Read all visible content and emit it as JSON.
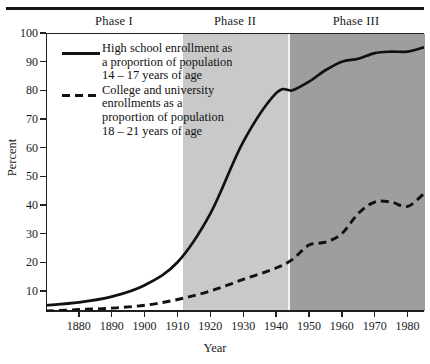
{
  "figure": {
    "y_axis_title": "Percent",
    "x_axis_title": "Year"
  },
  "phases": [
    {
      "name": "phase-1",
      "label": "Phase I",
      "start": 1870,
      "end": 1910,
      "shade": "#ffffff"
    },
    {
      "name": "phase-2",
      "label": "Phase II",
      "start": 1910,
      "end": 1940,
      "shade": "#c9c9c9"
    },
    {
      "name": "phase-3",
      "label": "Phase III",
      "start": 1940,
      "end": 1985,
      "shade": "#9e9e9e"
    }
  ],
  "legend": {
    "entries": [
      {
        "style": "solid",
        "line1": "High school enrollment as",
        "line2": "a proportion of population",
        "line3": "14 – 17 years of age"
      },
      {
        "style": "dashed",
        "line1": "College and university",
        "line2": "enrollments as a",
        "line3": "proportion of population",
        "line4": "18 – 21 years of age"
      }
    ]
  },
  "axes": {
    "y_ticks": [
      "100",
      "90",
      "80",
      "70",
      "60",
      "50",
      "40",
      "30",
      "20",
      "10"
    ],
    "y_values": [
      100,
      90,
      80,
      70,
      60,
      50,
      40,
      30,
      20,
      10
    ],
    "x_ticks": [
      "1880",
      "1890",
      "1900",
      "1910",
      "1920",
      "1930",
      "1940",
      "1950",
      "1960",
      "1970",
      "1980"
    ],
    "x_values": [
      1880,
      1890,
      1900,
      1910,
      1920,
      1930,
      1940,
      1950,
      1960,
      1970,
      1980
    ]
  },
  "chart_data": {
    "type": "line",
    "title": "",
    "xlabel": "Year",
    "ylabel": "Percent",
    "xlim": [
      1870,
      1985
    ],
    "ylim": [
      3,
      100
    ],
    "grid": false,
    "legend_position": "upper-left-inside",
    "annotations": [
      "Phase I",
      "Phase II",
      "Phase III"
    ],
    "phase_boundaries": [
      1910,
      1940
    ],
    "series": [
      {
        "name": "High school enrollment as a proportion of population 14 – 17 years of age",
        "style": "solid",
        "color": "#111111",
        "x": [
          1870,
          1880,
          1890,
          1900,
          1910,
          1920,
          1930,
          1940,
          1945,
          1950,
          1955,
          1960,
          1965,
          1970,
          1975,
          1980,
          1985
        ],
        "y": [
          5,
          6,
          8,
          12,
          20,
          37,
          62,
          79,
          80,
          83,
          87,
          90,
          91,
          93,
          93.5,
          93.5,
          95
        ]
      },
      {
        "name": "College and university enrollments as a proportion of population 18 – 21 years of age",
        "style": "dashed",
        "color": "#111111",
        "x": [
          1870,
          1880,
          1890,
          1900,
          1910,
          1920,
          1930,
          1940,
          1945,
          1950,
          1955,
          1960,
          1965,
          1970,
          1975,
          1980,
          1985
        ],
        "y": [
          3,
          3.5,
          4,
          5,
          7,
          10,
          14,
          18,
          21,
          26,
          27,
          30,
          37,
          41,
          41,
          39.5,
          44
        ]
      }
    ]
  }
}
